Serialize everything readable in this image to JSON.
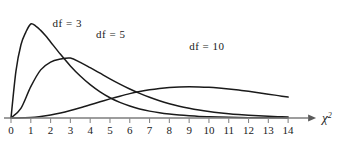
{
  "chart_data": {
    "type": "line",
    "title": "",
    "subtitle": "",
    "xlabel": "χ²",
    "ylabel": "",
    "xlim": [
      0,
      14.6
    ],
    "ylim": [
      0,
      0.26
    ],
    "grid": false,
    "legend_position": "inline-annotations",
    "x_ticks": [
      "0",
      "1",
      "2",
      "3",
      "4",
      "5",
      "6",
      "7",
      "8",
      "9",
      "10",
      "11",
      "12",
      "13",
      "14"
    ],
    "x_tick_values": [
      0,
      1,
      2,
      3,
      4,
      5,
      6,
      7,
      8,
      9,
      10,
      11,
      12,
      13,
      14
    ],
    "annotations": [
      {
        "text": "df = 3",
        "x": 2.1,
        "y": 0.235
      },
      {
        "text": "df = 5",
        "x": 4.3,
        "y": 0.205
      },
      {
        "text": "df = 10",
        "x": 9.0,
        "y": 0.175
      }
    ],
    "series": [
      {
        "name": "df = 3",
        "df": 3,
        "peak_x": 1.0,
        "peak_y": 0.242,
        "x": [
          0,
          0.25,
          0.5,
          0.75,
          1,
          1.25,
          1.5,
          1.75,
          2,
          2.5,
          3,
          3.5,
          4,
          4.5,
          5,
          5.5,
          6,
          6.5,
          7,
          7.5,
          8,
          8.5,
          9,
          9.5,
          10,
          10.5,
          11,
          11.5,
          12,
          12.5,
          13,
          13.5,
          14
        ],
        "y": [
          0,
          0.1209,
          0.188,
          0.2211,
          0.242,
          0.2367,
          0.2255,
          0.2115,
          0.1958,
          0.1639,
          0.1341,
          0.108,
          0.0858,
          0.0673,
          0.0522,
          0.0402,
          0.0308,
          0.0234,
          0.0177,
          0.0133,
          0.01,
          0.0075,
          0.0056,
          0.0041,
          0.0031,
          0.0023,
          0.0017,
          0.0012,
          0.0009,
          0.0007,
          0.0005,
          0.0004,
          0.0003
        ]
      },
      {
        "name": "df = 5",
        "df": 5,
        "peak_x": 3.0,
        "peak_y": 0.1542,
        "x": [
          0,
          0.5,
          1,
          1.5,
          2,
          2.5,
          3,
          3.5,
          4,
          4.5,
          5,
          5.5,
          6,
          6.5,
          7,
          7.5,
          8,
          8.5,
          9,
          9.5,
          10,
          10.5,
          11,
          11.5,
          12,
          12.5,
          13,
          13.5,
          14
        ],
        "y": [
          0,
          0.0247,
          0.0807,
          0.1239,
          0.144,
          0.1516,
          0.1542,
          0.1432,
          0.1296,
          0.1153,
          0.1009,
          0.0873,
          0.0747,
          0.0634,
          0.0533,
          0.0445,
          0.0369,
          0.0304,
          0.025,
          0.0204,
          0.0166,
          0.0134,
          0.0108,
          0.0087,
          0.0069,
          0.0055,
          0.0044,
          0.0035,
          0.0027
        ]
      },
      {
        "name": "df = 10",
        "df": 10,
        "peak_x": 8.0,
        "peak_y": 0.0976,
        "x": [
          0,
          1,
          1.5,
          2,
          2.5,
          3,
          3.5,
          4,
          4.5,
          5,
          5.5,
          6,
          6.5,
          7,
          7.5,
          8,
          8.5,
          9,
          9.5,
          10,
          10.5,
          11,
          11.5,
          12,
          12.5,
          13,
          13.5,
          14
        ],
        "y": [
          0,
          0.0016,
          0.004,
          0.0077,
          0.0128,
          0.0191,
          0.0263,
          0.0339,
          0.0417,
          0.0492,
          0.0562,
          0.0627,
          0.0681,
          0.0727,
          0.0762,
          0.0786,
          0.08,
          0.0804,
          0.08,
          0.0789,
          0.077,
          0.0746,
          0.0718,
          0.0686,
          0.0651,
          0.0614,
          0.0576,
          0.0538
        ]
      }
    ]
  },
  "colors": {
    "curve": "#1a1a1a",
    "axis": "#8a8a8a",
    "text": "#1a1a1a",
    "background": "#ffffff"
  }
}
